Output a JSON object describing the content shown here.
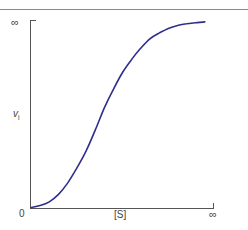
{
  "chart_data": {
    "type": "line",
    "title": "",
    "subtitle": "",
    "xlabel": "[S]",
    "ylabel": "v",
    "ylabel_subscript": "i",
    "x_ticks": [
      "0",
      "∞"
    ],
    "y_ticks": [
      "0",
      "∞"
    ],
    "xlim": [
      0,
      1
    ],
    "ylim": [
      0,
      1
    ],
    "grid": false,
    "legend": null,
    "curve_shape": "sigmoidal",
    "series": [
      {
        "name": "initial velocity vs substrate concentration",
        "color": "#2e2f8a",
        "x": [
          0.0,
          0.05,
          0.1,
          0.15,
          0.2,
          0.25,
          0.3,
          0.35,
          0.4,
          0.45,
          0.5,
          0.55,
          0.6,
          0.65,
          0.7,
          0.75,
          0.8,
          0.85,
          0.9,
          0.95
        ],
        "y": [
          0.0,
          0.01,
          0.03,
          0.07,
          0.13,
          0.21,
          0.3,
          0.41,
          0.53,
          0.63,
          0.72,
          0.79,
          0.85,
          0.9,
          0.93,
          0.955,
          0.97,
          0.98,
          0.985,
          0.99
        ]
      }
    ]
  },
  "axes": {
    "y_max_label": "∞",
    "y_label": "v",
    "y_label_sub": "i",
    "origin_label": "0",
    "x_label": "[S]",
    "x_max_label": "∞"
  },
  "colors": {
    "curve": "#2e2f8a",
    "axis": "#555555",
    "frame": "#8a8a8a",
    "text": "#444444"
  }
}
